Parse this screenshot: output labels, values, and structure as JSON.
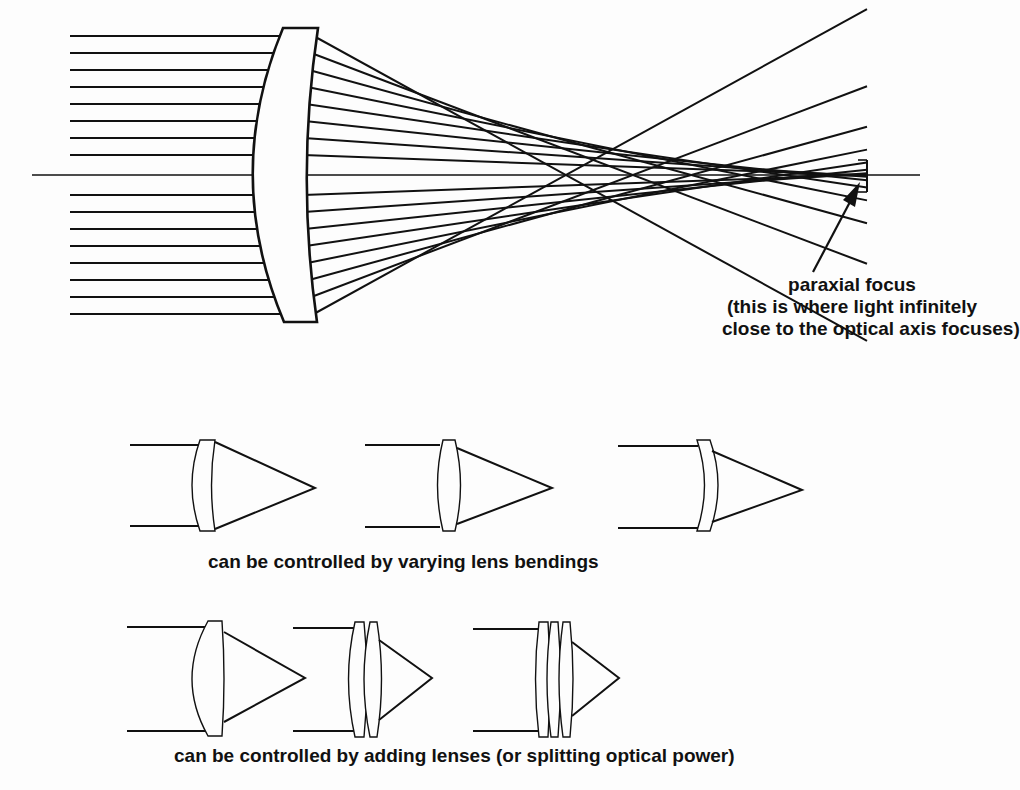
{
  "figure": {
    "top_diagram": {
      "description": "Parallel rays through a single positive meniscus lens showing spherical aberration; marginal rays focus before the paraxial focus",
      "ray_count": 16,
      "annotation": {
        "line1": "paraxial focus",
        "line2": "(this is where light infinitely",
        "line3": "close to the optical axis focuses)"
      }
    },
    "row1": {
      "caption": "can be controlled by varying lens bendings",
      "variants": [
        "meniscus-left-convex",
        "biconvex",
        "meniscus-right-concave"
      ]
    },
    "row2": {
      "caption": "can be controlled by adding lenses (or splitting optical power)",
      "variants": [
        "one-lens",
        "two-lenses",
        "three-lenses"
      ]
    },
    "colors": {
      "ink": "#111111",
      "paper": "#fdfdfd"
    }
  }
}
